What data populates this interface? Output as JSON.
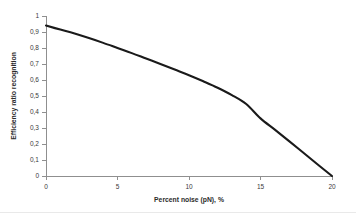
{
  "chart_data": {
    "type": "line",
    "title": "",
    "subtitle": "",
    "xlabel": "Percent noise (pN), %",
    "ylabel": "Efficiency ratio recognition",
    "xlim": [
      0,
      20
    ],
    "ylim": [
      0,
      1
    ],
    "grid": false,
    "legend": "none",
    "decimal_separator": ",",
    "x_ticks": [
      0,
      5,
      10,
      15,
      20
    ],
    "x_tick_labels": [
      "0",
      "5",
      "10",
      "15",
      "20"
    ],
    "y_ticks": [
      0,
      0.1,
      0.2,
      0.3,
      0.4,
      0.5,
      0.6,
      0.7,
      0.8,
      0.9,
      1
    ],
    "y_tick_labels": [
      "0",
      "0,1",
      "0,2",
      "0,3",
      "0,4",
      "0,5",
      "0,6",
      "0,7",
      "0,8",
      "0,9",
      "1"
    ],
    "series": [
      {
        "name": "Efficiency ratio recognition",
        "color": "#1a1a1a",
        "x": [
          0,
          1,
          2,
          3,
          4,
          5,
          6,
          7,
          8,
          9,
          10,
          11,
          12,
          13,
          14,
          15,
          16,
          17,
          18,
          19,
          20
        ],
        "values": [
          0.94,
          0.915,
          0.89,
          0.862,
          0.832,
          0.8,
          0.768,
          0.734,
          0.7,
          0.665,
          0.63,
          0.592,
          0.552,
          0.506,
          0.45,
          0.36,
          0.29,
          0.218,
          0.145,
          0.072,
          0.0
        ]
      }
    ]
  },
  "axes": {
    "x_axis_title": "Percent noise (pN), %",
    "y_axis_title": "Efficiency ratio recognition"
  }
}
